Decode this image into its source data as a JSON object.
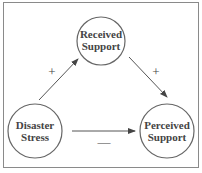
{
  "diagram": {
    "nodes": [
      {
        "id": "received",
        "line1": "Received",
        "line2": "Support"
      },
      {
        "id": "disaster",
        "line1": "Disaster",
        "line2": "Stress"
      },
      {
        "id": "perceived",
        "line1": "Perceived",
        "line2": "Support"
      }
    ],
    "edges": [
      {
        "from": "disaster",
        "to": "received",
        "sign": "+"
      },
      {
        "from": "received",
        "to": "perceived",
        "sign": "+"
      },
      {
        "from": "disaster",
        "to": "perceived",
        "sign": "—"
      }
    ],
    "colors": {
      "stroke": "#555555",
      "text": "#444444",
      "border": "#8a8a8a"
    }
  }
}
